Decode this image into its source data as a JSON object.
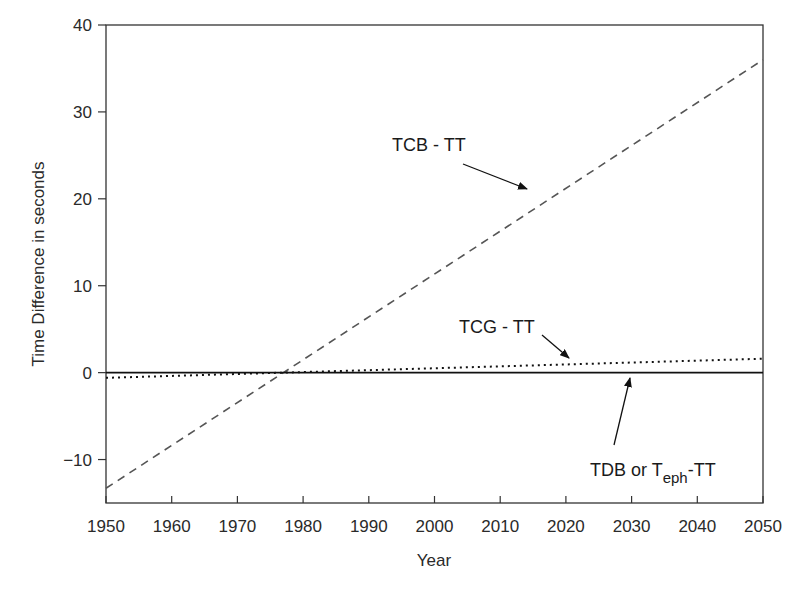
{
  "chart_data": {
    "type": "line",
    "title": "",
    "xlabel": "Year",
    "ylabel": "Time Difference in seconds",
    "xlim": [
      1950,
      2050
    ],
    "ylim": [
      -15,
      40
    ],
    "xticks": [
      1950,
      1960,
      1970,
      1980,
      1990,
      2000,
      2010,
      2020,
      2030,
      2040,
      2050
    ],
    "xtick_labels": [
      "1950",
      "1960",
      "1970",
      "1980",
      "1990",
      "2000",
      "2010",
      "2020",
      "2030",
      "2040",
      "2050"
    ],
    "yticks": [
      -10,
      0,
      10,
      20,
      30,
      40
    ],
    "ytick_labels": [
      "−10",
      "0",
      "10",
      "20",
      "30",
      "40"
    ],
    "grid": false,
    "legend": "none (inline annotations with arrows)",
    "x": [
      1950,
      1977,
      2050
    ],
    "series": [
      {
        "name": "TCB - TT",
        "style": "dashed",
        "color": "#555555",
        "values": [
          -13.3,
          0.0,
          36.0
        ]
      },
      {
        "name": "TCG - TT",
        "style": "dotted",
        "color": "#111111",
        "values": [
          -0.6,
          0.0,
          1.6
        ]
      },
      {
        "name": "TDB or Teph-TT",
        "style": "solid",
        "color": "#111111",
        "values": [
          0.0,
          0.0,
          0.0
        ]
      }
    ],
    "annotations": [
      {
        "text": "TCB - TT",
        "arrow_to": [
          2015,
          18.3
        ]
      },
      {
        "text": "TCG - TT",
        "arrow_to": [
          2021,
          1.1
        ]
      },
      {
        "text": "TDB or Teph-TT",
        "arrow_to": [
          2030,
          0.0
        ]
      }
    ]
  },
  "labels": {
    "xlabel": "Year",
    "ylabel": "Time Difference in seconds",
    "annot_tcb": "TCB - TT",
    "annot_tcg": "TCG - TT",
    "annot_tdb_prefix": "TDB or T",
    "annot_tdb_sub": "eph",
    "annot_tdb_suffix": "-TT"
  }
}
